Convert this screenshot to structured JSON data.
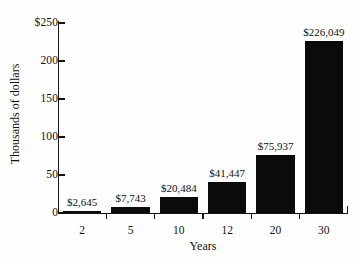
{
  "chart_data": {
    "type": "bar",
    "title": "",
    "subtitle": "",
    "xlabel": "Years",
    "ylabel": "Thousands of dollars",
    "categories": [
      "2",
      "5",
      "10",
      "12",
      "20",
      "30"
    ],
    "values": [
      2.645,
      7.743,
      20.484,
      41.447,
      75.937,
      226.049
    ],
    "data_labels": [
      "$2,645",
      "$7,743",
      "$20,484",
      "$41,447",
      "$75,937",
      "$226,049"
    ],
    "raw_values": [
      2645,
      7743,
      20484,
      41447,
      75937,
      226049
    ],
    "value_units": "thousands of dollars",
    "ylim": [
      0,
      250
    ],
    "ytick_values": [
      0,
      50,
      100,
      150,
      200,
      250
    ],
    "ytick_labels": [
      "0",
      "50",
      "100",
      "150",
      "200",
      "$250"
    ],
    "grid": false,
    "legend": null,
    "legend_position": "none",
    "bar_color": "#0b0b0b",
    "axis_color": "#141414",
    "background_color": "#fefefe",
    "text_color": "#111111"
  }
}
